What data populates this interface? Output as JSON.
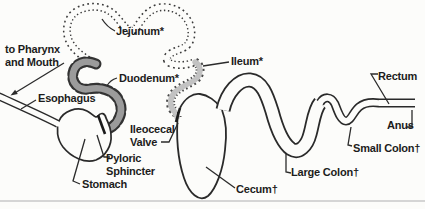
{
  "labels": {
    "pharynx_line1": "to Pharynx",
    "pharynx_line2": "and Mouth",
    "esophagus": "Esophagus",
    "jejunum": "Jejunum*",
    "duodenum": "Duodenum*",
    "ileum": "Ileum*",
    "ileocecal_line1": "Ileocecal",
    "ileocecal_line2": "Valve",
    "pyloric_line1": "Pyloric",
    "pyloric_line2": "Sphincter",
    "stomach": "Stomach",
    "cecum": "Cecum†",
    "large_colon": "Large Colon†",
    "small_colon": "Small Colon†",
    "rectum": "Rectum",
    "anus": "Anus"
  },
  "colors": {
    "outline": "#2a2a2a",
    "leader": "#2b2b2b",
    "text": "#1c1c1c",
    "duodenum_fill": "#9b9b9b",
    "ileum_fill": "#c2c2c2",
    "background": "#fcfcfa",
    "faint_rule": "#c8c8c8"
  }
}
